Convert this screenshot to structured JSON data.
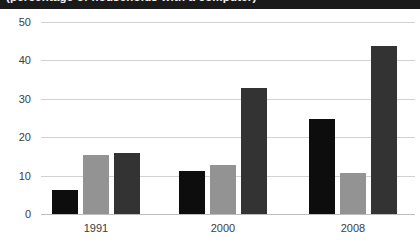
{
  "title": {
    "text": "(percentage of households with a computer)",
    "banner_color": "#1a1a1a",
    "cropped": "true"
  },
  "chart_data": {
    "type": "bar",
    "title": "(percentage of households with a computer)",
    "xlabel": "",
    "ylabel": "",
    "categories": [
      "1991",
      "2000",
      "2008"
    ],
    "ylim": [
      0,
      50
    ],
    "yticks": [
      "0",
      "10",
      "20",
      "30",
      "40",
      "50"
    ],
    "grid": "horizontal",
    "legend": "none",
    "series": [
      {
        "name": "series-1",
        "color": "#0d0d0d",
        "values": [
          6.3,
          11.2,
          24.8
        ]
      },
      {
        "name": "series-2",
        "color": "#939393",
        "values": [
          15.4,
          12.8,
          10.7
        ]
      },
      {
        "name": "series-3",
        "color": "#333333",
        "values": [
          16.0,
          32.7,
          43.8
        ]
      }
    ]
  },
  "axis": {
    "y_tick_labels": [
      "50",
      "40",
      "30",
      "20",
      "10",
      "0"
    ],
    "x_tick_labels": [
      "1991",
      "2000",
      "2008"
    ]
  },
  "colors": {
    "series_1": "#0d0d0d",
    "series_2": "#939393",
    "series_3": "#333333",
    "gridline": "#d2d2d2",
    "baseline": "#bdbdbd",
    "text": "#3c3c3c",
    "background": "#ffffff"
  }
}
